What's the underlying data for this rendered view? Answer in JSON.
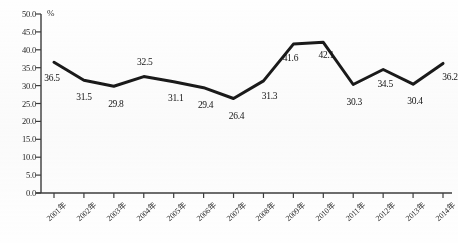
{
  "chart_data": {
    "type": "line",
    "title": "",
    "subtitle": "",
    "xlabel": "",
    "ylabel": "",
    "unit_label": "%",
    "categories": [
      "2001年",
      "2002年",
      "2003年",
      "2004年",
      "2005年",
      "2006年",
      "2007年",
      "2008年",
      "2009年",
      "2010年",
      "2011年",
      "2012年",
      "2013年",
      "2014年"
    ],
    "values": [
      36.5,
      31.5,
      29.8,
      32.5,
      31.1,
      29.4,
      26.4,
      31.3,
      41.6,
      42.1,
      30.3,
      34.5,
      30.4,
      36.2
    ],
    "value_labels": [
      "36.5",
      "31.5",
      "29.8",
      "32.5",
      "31.1",
      "29.4",
      "26.4",
      "31.3",
      "41.6",
      "42.1",
      "30.3",
      "34.5",
      "30.4",
      "36.2"
    ],
    "ylim": [
      0.0,
      50.0
    ],
    "ytick_step": 5.0,
    "ytick_labels": [
      "50.0",
      "45.0",
      "40.0",
      "35.0",
      "30.0",
      "25.0",
      "20.0",
      "15.0",
      "10.0",
      "5.0",
      "0.0"
    ],
    "ytick_values": [
      50.0,
      45.0,
      40.0,
      35.0,
      30.0,
      25.0,
      20.0,
      15.0,
      10.0,
      5.0,
      0.0
    ],
    "grid": false,
    "legend": null,
    "legend_position": "none",
    "series": [
      {
        "name": "",
        "values": [
          36.5,
          31.5,
          29.8,
          32.5,
          31.1,
          29.4,
          26.4,
          31.3,
          41.6,
          42.1,
          30.3,
          34.5,
          30.4,
          36.2
        ],
        "color": "#1a1a1a",
        "line_width": 3,
        "markers": false
      }
    ],
    "annotations": [],
    "colors": {
      "line": "#1a1a1a",
      "axis": "#3a3a3a",
      "text": "#1f1f1f",
      "background": "#ffffff"
    },
    "label_offsets": [
      {
        "dx": -2,
        "dy": 16
      },
      {
        "dx": 0,
        "dy": 17
      },
      {
        "dx": 2,
        "dy": 18
      },
      {
        "dx": 1,
        "dy": -15
      },
      {
        "dx": 2,
        "dy": 16
      },
      {
        "dx": 2,
        "dy": 17
      },
      {
        "dx": 3,
        "dy": 18
      },
      {
        "dx": 6,
        "dy": 15
      },
      {
        "dx": -3,
        "dy": 14
      },
      {
        "dx": 3,
        "dy": 13
      },
      {
        "dx": 1,
        "dy": 17
      },
      {
        "dx": 2,
        "dy": 15
      },
      {
        "dx": 2,
        "dy": 17
      },
      {
        "dx": 7,
        "dy": 14
      }
    ]
  }
}
